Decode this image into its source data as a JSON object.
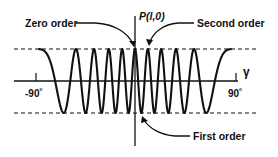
{
  "figure": {
    "colors": {
      "ink": "#111111",
      "background": "#ffffff"
    },
    "axes": {
      "x_label": "γ",
      "y_label": "P(l,0)",
      "x_ticks": [
        {
          "label": "-90˚",
          "value": -90
        },
        {
          "label": "90˚",
          "value": 90
        }
      ]
    },
    "reference_lines": {
      "upper": "dashed, +1 amplitude",
      "lower": "dashed, -1 amplitude"
    },
    "annotations": {
      "zero_order": "Zero order",
      "second_order": "Second order",
      "first_order": "First order"
    },
    "curve": {
      "function": "cos(k·sin γ)",
      "k": 31.4,
      "gamma_range_deg": [
        -87,
        87
      ]
    }
  }
}
